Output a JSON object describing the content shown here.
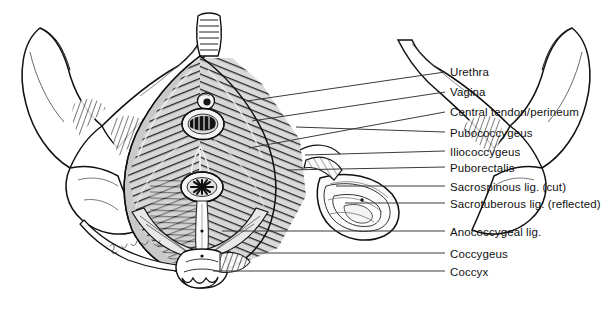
{
  "figure": {
    "background_color": "#ffffff",
    "ink_color": "#111111",
    "leader_line_color": "#3a3a3a",
    "signature": "Sinatra 94"
  },
  "labels": [
    {
      "id": "urethra",
      "text": "Urethra",
      "text_x": 450,
      "text_y": 66,
      "leader_x1": 247,
      "leader_y1": 101,
      "leader_x2": 445,
      "leader_y2": 72
    },
    {
      "id": "vagina",
      "text": "Vagina",
      "text_x": 450,
      "text_y": 86,
      "leader_x1": 252,
      "leader_y1": 121,
      "leader_x2": 445,
      "leader_y2": 92
    },
    {
      "id": "central-tendon",
      "text": "Central tendon/perineum",
      "text_x": 450,
      "text_y": 106,
      "leader_x1": 249,
      "leader_y1": 148,
      "leader_x2": 445,
      "leader_y2": 112
    },
    {
      "id": "pubococcygeus",
      "text": "Pubococcygeus",
      "text_x": 450,
      "text_y": 127,
      "leader_x1": 296,
      "leader_y1": 127,
      "leader_x2": 445,
      "leader_y2": 132
    },
    {
      "id": "iliococcygeus",
      "text": "Iliococcygeus",
      "text_x": 450,
      "text_y": 146,
      "leader_x1": 305,
      "leader_y1": 155,
      "leader_x2": 445,
      "leader_y2": 151
    },
    {
      "id": "puborectalis",
      "text": "Puborectalis",
      "text_x": 450,
      "text_y": 162,
      "leader_x1": 287,
      "leader_y1": 170,
      "leader_x2": 445,
      "leader_y2": 167
    },
    {
      "id": "sacrospinous",
      "text": "Sacrospinous lig. (cut)",
      "text_x": 450,
      "text_y": 181,
      "leader_x1": 336,
      "leader_y1": 186,
      "leader_x2": 445,
      "leader_y2": 186
    },
    {
      "id": "sacrotuberous",
      "text": "Sacrotuberous lig. (reflected)",
      "text_x": 450,
      "text_y": 198,
      "leader_x1": 345,
      "leader_y1": 203,
      "leader_x2": 445,
      "leader_y2": 203
    },
    {
      "id": "anococcygeal",
      "text": "Anococcygeal lig.",
      "text_x": 450,
      "text_y": 226,
      "leader_x1": 222,
      "leader_y1": 231,
      "leader_x2": 445,
      "leader_y2": 231
    },
    {
      "id": "coccygeus",
      "text": "Coccygeus",
      "text_x": 450,
      "text_y": 248,
      "leader_x1": 253,
      "leader_y1": 253,
      "leader_x2": 445,
      "leader_y2": 253
    },
    {
      "id": "coccyx",
      "text": "Coccyx",
      "text_x": 450,
      "text_y": 266,
      "leader_x1": 213,
      "leader_y1": 271,
      "leader_x2": 445,
      "leader_y2": 271
    }
  ],
  "structures": [
    {
      "id": "pubic-symphysis",
      "name": "Pubic symphysis"
    },
    {
      "id": "left-ilium",
      "name": "Left ilium / iliac crest"
    },
    {
      "id": "right-ilium",
      "name": "Right ilium / iliac crest"
    },
    {
      "id": "left-ischium",
      "name": "Left ischial tuberosity"
    },
    {
      "id": "right-ischium",
      "name": "Right ischial tuberosity"
    },
    {
      "id": "levator-ani-sheet",
      "name": "Levator ani muscle sheet"
    },
    {
      "id": "urethral-orifice",
      "name": "Urethral orifice"
    },
    {
      "id": "vaginal-orifice",
      "name": "Vaginal orifice"
    },
    {
      "id": "anal-orifice",
      "name": "Anal orifice"
    },
    {
      "id": "sacrotuberous-reflected",
      "name": "Reflected sacrotuberous ligament"
    },
    {
      "id": "coccyx-bone",
      "name": "Coccyx"
    }
  ]
}
